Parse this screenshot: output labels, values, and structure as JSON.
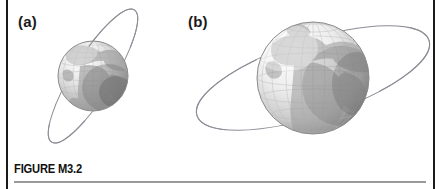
{
  "figure": {
    "caption": "FIGURE M3.2",
    "panels": [
      {
        "id": "a",
        "label": "(a)",
        "subject": "earth-globe",
        "orbit": "steeply-inclined-narrow-elliptical-orbit",
        "globe_diameter_px": 70,
        "globe_center": {
          "x": 93,
          "y": 76
        },
        "orbit_tilt_deg": -58,
        "orbit_semi_major_px": 78,
        "orbit_semi_minor_px": 20,
        "visible_continents": "Africa, Europe, Asia",
        "graticule": "latitude and longitude grid"
      },
      {
        "id": "b",
        "label": "(b)",
        "subject": "earth-globe",
        "orbit": "shallow-inclined-wide-elliptical-orbit",
        "globe_diameter_px": 112,
        "globe_center": {
          "x": 313,
          "y": 78
        },
        "orbit_tilt_deg": -18,
        "orbit_semi_major_px": 122,
        "orbit_semi_minor_px": 38,
        "visible_continents": "Africa, Europe, Asia",
        "graticule": "latitude and longitude grid"
      }
    ]
  },
  "colors": {
    "edge_rule": "#1a1a1a",
    "caption_text": "#111111",
    "caption_rule": "#9a9a9a",
    "orbit_line": "#8d8d97",
    "globe_outline": "#8a8a8a",
    "background": "#ffffff"
  }
}
